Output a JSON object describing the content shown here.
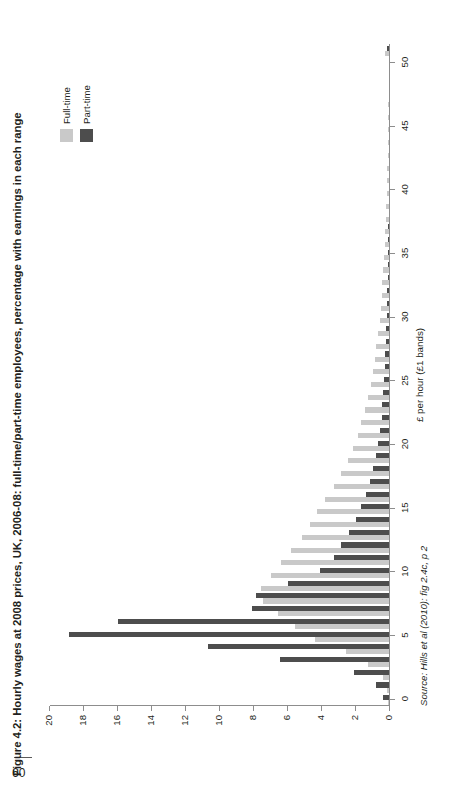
{
  "page": {
    "number": "60"
  },
  "figure": {
    "title": "Figure 4.2: Hourly wages at 2008 prices, UK, 2006-08: full-time/part-time employees, percentage with earnings in each range",
    "source": "Source: Hills et al (2010): fig 2.4c, p 2"
  },
  "legend": {
    "position": "top-right",
    "items": [
      {
        "label": "Full-time",
        "color": "#c9c9c9",
        "swatch_name": "legend-swatch-full-time"
      },
      {
        "label": "Part-time",
        "color": "#4d4d4d",
        "swatch_name": "legend-swatch-part-time"
      }
    ]
  },
  "chart_data": {
    "type": "bar",
    "orientation": "vertical",
    "title": "Figure 4.2: Hourly wages at 2008 prices, UK, 2006-08: full-time/part-time employees, percentage with earnings in each range",
    "xlabel": "£ per hour (£1 bands)",
    "ylabel": "",
    "xlim": [
      0,
      52
    ],
    "ylim": [
      0,
      20
    ],
    "grid": false,
    "x_ticks": [
      0,
      5,
      10,
      15,
      20,
      25,
      30,
      35,
      40,
      45,
      50
    ],
    "y_ticks": [
      0,
      2,
      4,
      6,
      8,
      10,
      12,
      14,
      16,
      18,
      20
    ],
    "categories": [
      0,
      1,
      2,
      3,
      4,
      5,
      6,
      7,
      8,
      9,
      10,
      11,
      12,
      13,
      14,
      15,
      16,
      17,
      18,
      19,
      20,
      21,
      22,
      23,
      24,
      25,
      26,
      27,
      28,
      29,
      30,
      31,
      32,
      33,
      34,
      35,
      36,
      37,
      38,
      39,
      40,
      41,
      42,
      43,
      44,
      45,
      46,
      47,
      48,
      49,
      50,
      51
    ],
    "series": [
      {
        "name": "Full-time",
        "color": "#c9c9c9",
        "values": [
          0.1,
          0.2,
          0.4,
          1.3,
          2.6,
          4.4,
          5.6,
          6.6,
          7.5,
          7.6,
          7.0,
          6.4,
          5.8,
          5.2,
          4.7,
          4.3,
          3.8,
          3.3,
          2.9,
          2.5,
          2.2,
          1.9,
          1.7,
          1.5,
          1.3,
          1.1,
          1.0,
          0.9,
          0.8,
          0.7,
          0.6,
          0.55,
          0.5,
          0.45,
          0.4,
          0.35,
          0.3,
          0.28,
          0.25,
          0.22,
          0.2,
          0.18,
          0.16,
          0.14,
          0.12,
          0.11,
          0.1,
          0.09,
          0.08,
          0.07,
          0.06,
          0.3
        ]
      },
      {
        "name": "Part-time",
        "color": "#4d4d4d",
        "values": [
          0.4,
          0.8,
          2.1,
          6.5,
          10.7,
          18.9,
          16.0,
          8.1,
          7.9,
          6.0,
          4.1,
          3.3,
          2.9,
          2.4,
          2.0,
          1.7,
          1.4,
          1.2,
          1.0,
          0.85,
          0.7,
          0.6,
          0.5,
          0.45,
          0.4,
          0.35,
          0.3,
          0.27,
          0.24,
          0.21,
          0.18,
          0.16,
          0.15,
          0.13,
          0.12,
          0.11,
          0.1,
          0.09,
          0.08,
          0.07,
          0.07,
          0.06,
          0.05,
          0.05,
          0.04,
          0.04,
          0.03,
          0.03,
          0.03,
          0.02,
          0.02,
          0.15
        ]
      }
    ]
  }
}
